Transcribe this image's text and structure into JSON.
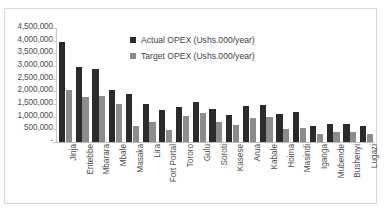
{
  "chart_data": {
    "type": "bar",
    "title": "",
    "xlabel": "",
    "ylabel": "",
    "ylim": [
      0,
      4500000
    ],
    "ytick_values": [
      0,
      500000,
      1000000,
      1500000,
      2000000,
      2500000,
      3000000,
      3500000,
      4000000,
      4500000
    ],
    "ytick_labels": [
      "-",
      "500,000",
      "1,000,000",
      "1,500,000",
      "2,000,000",
      "2,500,000",
      "3,000,000",
      "3,500,000",
      "4,000,000",
      "4,500,000"
    ],
    "grid": false,
    "legend_position": "inside-top-center",
    "categories": [
      "Jinja",
      "Entebbe",
      "Mbarara",
      "Mbale",
      "Masaka",
      "Lira",
      "Fort Portal",
      "Tororo",
      "Gulu",
      "Soroti",
      "Kasese",
      "Arua",
      "Kabale",
      "Hoima",
      "Masindi",
      "Iganga",
      "Mubende",
      "Bushenyi",
      "Lugazi"
    ],
    "series": [
      {
        "name": "Actual OPEX (Ushs.000/year)",
        "color": "#2b2b2b",
        "values": [
          3950000,
          2980000,
          2900000,
          2060000,
          1880000,
          1500000,
          1270000,
          1390000,
          1560000,
          1300000,
          1060000,
          1430000,
          1450000,
          1090000,
          1180000,
          620000,
          700000,
          720000,
          620000
        ]
      },
      {
        "name": "Target OPEX (Ushs.000/year)",
        "color": "#8c8c8c",
        "values": [
          2060000,
          1780000,
          1820000,
          1520000,
          640000,
          800000,
          480000,
          1040000,
          1130000,
          800000,
          680000,
          930000,
          970000,
          520000,
          570000,
          330000,
          400000,
          400000,
          300000
        ]
      }
    ]
  },
  "legend": {
    "items": [
      {
        "label": "Actual OPEX (Ushs.000/year)"
      },
      {
        "label": "Target OPEX (Ushs.000/year)"
      }
    ]
  }
}
